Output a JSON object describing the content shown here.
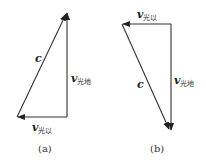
{
  "diagram": {
    "type": "vector-triangles",
    "panels": [
      {
        "id": "a",
        "caption": "(a)",
        "vectors": [
          {
            "name": "c",
            "label": "c",
            "subscript": ""
          },
          {
            "name": "v_light_earth",
            "label": "v",
            "subscript": "光地"
          },
          {
            "name": "v_light_ether",
            "label": "v",
            "subscript": "光以"
          }
        ]
      },
      {
        "id": "b",
        "caption": "(b)",
        "vectors": [
          {
            "name": "c",
            "label": "c",
            "subscript": ""
          },
          {
            "name": "v_light_earth",
            "label": "v",
            "subscript": "光地"
          },
          {
            "name": "v_light_ether",
            "label": "v",
            "subscript": "光以"
          }
        ]
      }
    ]
  },
  "colors": {
    "line": "#333333",
    "background": "#ffffff"
  }
}
